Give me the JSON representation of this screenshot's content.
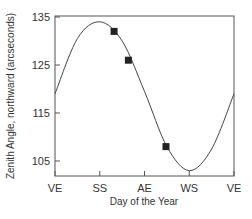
{
  "chart_data": {
    "type": "line",
    "title": "",
    "xlabel": "Day of the Year",
    "ylabel": "Zenith Angle, northward (arcseconds)",
    "x_ticks": [
      "VE",
      "SS",
      "AE",
      "WS",
      "VE"
    ],
    "y_ticks": [
      105,
      115,
      125,
      135
    ],
    "ylim": [
      101,
      135
    ],
    "grid": false,
    "legend": null,
    "series": [
      {
        "name": "model curve",
        "style": "line",
        "x_fraction": [
          0,
          0.125,
          0.25,
          0.375,
          0.5,
          0.625,
          0.75,
          0.875,
          1.0
        ],
        "values": [
          119,
          130.5,
          134,
          130,
          119.5,
          108,
          103,
          107.5,
          119
        ]
      },
      {
        "name": "observations",
        "style": "square-markers",
        "x_fraction": [
          0.33,
          0.41,
          0.62
        ],
        "values": [
          132,
          126,
          108
        ]
      }
    ]
  }
}
